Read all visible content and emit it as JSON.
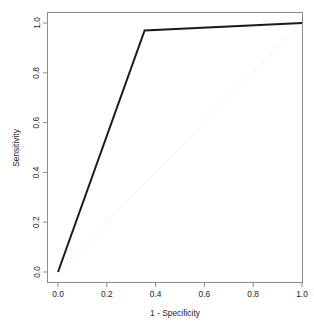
{
  "chart_data": {
    "type": "line",
    "title": "",
    "subtitle": "",
    "xlabel": "1 - Specificity",
    "ylabel": "Sensitivity",
    "xlim": [
      0,
      1
    ],
    "ylim": [
      0,
      1
    ],
    "grid": false,
    "legend": null,
    "legend_position": "none",
    "xticks": [
      0.0,
      0.2,
      0.4,
      0.6,
      0.8,
      1.0
    ],
    "xtick_labels": [
      "0.0",
      "0.2",
      "0.4",
      "0.6",
      "0.8",
      "1.0"
    ],
    "yticks": [
      0.0,
      0.2,
      0.4,
      0.6,
      0.8,
      1.0
    ],
    "ytick_labels": [
      "0.0",
      "0.2",
      "0.4",
      "0.6",
      "0.8",
      "1.0"
    ],
    "series": [
      {
        "name": "ROC curve",
        "color": "#1a1a1a",
        "line_width": 2.0,
        "x": [
          0.0,
          0.355,
          1.0
        ],
        "y": [
          0.0,
          0.97,
          1.0
        ]
      },
      {
        "name": "chance diagonal",
        "color": "#f2f2f2",
        "line_width": 1.0,
        "x": [
          0.0,
          1.0
        ],
        "y": [
          0.0,
          1.0
        ]
      }
    ],
    "annotations": []
  },
  "axes": {
    "x_title": "1 - Specificity",
    "y_title": "Sensitivity"
  }
}
